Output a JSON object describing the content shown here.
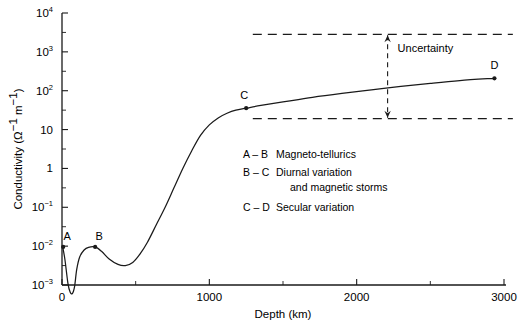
{
  "figure": {
    "background": "#ffffff",
    "ink": "#1a1a1a"
  },
  "axes": {
    "x": {
      "label": "Depth (km)",
      "ticks": [
        "0",
        "1000",
        "2000",
        "3000"
      ],
      "tickvalues": [
        0,
        1000,
        2000,
        3000
      ],
      "minor_tickvalues": [
        500,
        1500,
        2500
      ],
      "range": [
        0,
        3000
      ]
    },
    "y": {
      "label_prefix": "Conductivity (",
      "label_unit_base1": "Ω",
      "label_unit_sup1": "−1",
      "label_unit_base2": "m",
      "label_unit_sup2": "−1",
      "label_suffix": ")",
      "label_plain": "Conductivity (Ω−1 m−1)",
      "ticks": [
        {
          "base": "10",
          "sup": "4",
          "exp": 4
        },
        {
          "base": "10",
          "sup": "3",
          "exp": 3
        },
        {
          "base": "10",
          "sup": "2",
          "exp": 2
        },
        {
          "base": "10",
          "sup": "",
          "exp": 1
        },
        {
          "base": "1",
          "sup": "",
          "exp": 0
        },
        {
          "base": "10",
          "sup": "−1",
          "exp": -1
        },
        {
          "base": "10",
          "sup": "−2",
          "exp": -2
        },
        {
          "base": "10",
          "sup": "−3",
          "exp": -3
        }
      ],
      "range_exp": [
        -3,
        4
      ],
      "scale": "log"
    }
  },
  "point_labels": [
    {
      "id": "A",
      "label": "A",
      "depth_km": 8,
      "conductivity_exp": -2.02
    },
    {
      "id": "B",
      "label": "B",
      "depth_km": 225,
      "conductivity_exp": -2.02
    },
    {
      "id": "C",
      "label": "C",
      "depth_km": 1250,
      "conductivity_exp": 1.55
    },
    {
      "id": "D",
      "label": "D",
      "depth_km": 2935,
      "conductivity_exp": 2.32
    }
  ],
  "uncertainty": {
    "label": "Uncertainty",
    "upper_exp": 3.45,
    "lower_exp": 1.28,
    "band_start_km": 1295,
    "band_end_km": 3060,
    "arrow_depth_km": 2210
  },
  "legend": {
    "entries": [
      {
        "range": "A – B",
        "text": "Magneto-tellurics",
        "text2": ""
      },
      {
        "range": "B – C",
        "text": "Diurnal variation",
        "text2": "and magnetic storms"
      },
      {
        "range": "C – D",
        "text": "Secular variation",
        "text2": ""
      }
    ]
  },
  "chart_data": {
    "type": "line",
    "title": "",
    "xlabel": "Depth (km)",
    "ylabel": "Conductivity (Ω−1 m−1)",
    "yscale": "log",
    "xlim": [
      0,
      3000
    ],
    "ylim_exp": [
      -3,
      4
    ],
    "grid": false,
    "legend_position": "center",
    "series": [
      {
        "name": "Electrical conductivity of the Earth's interior",
        "x": [
          5,
          20,
          40,
          55,
          70,
          85,
          100,
          120,
          150,
          180,
          225,
          270,
          320,
          380,
          430,
          480,
          530,
          580,
          640,
          700,
          760,
          820,
          880,
          940,
          1000,
          1060,
          1120,
          1180,
          1250,
          1350,
          1500,
          1700,
          1900,
          2100,
          2300,
          2500,
          2700,
          2935
        ],
        "y_exp": [
          -2.02,
          -2.35,
          -2.95,
          -3.18,
          -3.22,
          -3.05,
          -2.6,
          -2.28,
          -2.1,
          -2.03,
          -2.02,
          -2.14,
          -2.33,
          -2.47,
          -2.5,
          -2.42,
          -2.2,
          -1.9,
          -1.45,
          -1.0,
          -0.5,
          0.0,
          0.45,
          0.85,
          1.12,
          1.3,
          1.42,
          1.5,
          1.55,
          1.62,
          1.71,
          1.83,
          1.93,
          2.02,
          2.11,
          2.19,
          2.26,
          2.32
        ]
      }
    ],
    "annotations": [
      {
        "text": "A",
        "x": 8,
        "y_exp": -2.02
      },
      {
        "text": "B",
        "x": 225,
        "y_exp": -2.02
      },
      {
        "text": "C",
        "x": 1250,
        "y_exp": 1.55
      },
      {
        "text": "D",
        "x": 2935,
        "y_exp": 2.32
      },
      {
        "text": "Uncertainty",
        "x": 2300,
        "y_exp": 3.1
      }
    ]
  }
}
